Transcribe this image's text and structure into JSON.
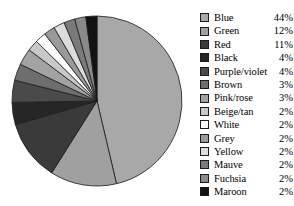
{
  "chart_data": {
    "type": "pie",
    "title": "",
    "subtitle": "",
    "xlabel": "",
    "ylabel": "",
    "grid": false,
    "legend_position": "right",
    "start_angle_deg": 0,
    "direction": "clockwise",
    "categories": [
      "Blue",
      "Green",
      "Red",
      "Black",
      "Purple/violet",
      "Brown",
      "Pink/rose",
      "Beige/tan",
      "White",
      "Grey",
      "Yellow",
      "Mauve",
      "Fuchsia",
      "Maroon"
    ],
    "values": [
      44,
      12,
      11,
      4,
      4,
      3,
      3,
      2,
      2,
      2,
      2,
      2,
      2,
      2
    ],
    "value_labels": [
      "44%",
      "12%",
      "11%",
      "4%",
      "4%",
      "3%",
      "3%",
      "2%",
      "2%",
      "2%",
      "2%",
      "2%",
      "2%",
      "2%"
    ],
    "unit": "%",
    "total": 95,
    "slice_colors": [
      "#a8a8a8",
      "#a0a0a0",
      "#3a3a3a",
      "#262626",
      "#4a4a4a",
      "#6e6e6e",
      "#a3a3a3",
      "#c8c8c8",
      "#ffffff",
      "#9a9a9a",
      "#dcdcdc",
      "#7a7a7a",
      "#8a8a8a",
      "#121212"
    ],
    "slice_stroke": "#1a1a1a"
  },
  "legend": {
    "items": [
      {
        "label": "Blue",
        "value": "44%",
        "swatch": "#a8a8a8"
      },
      {
        "label": "Green",
        "value": "12%",
        "swatch": "#a0a0a0"
      },
      {
        "label": "Red",
        "value": "11%",
        "swatch": "#3a3a3a"
      },
      {
        "label": "Black",
        "value": "4%",
        "swatch": "#262626"
      },
      {
        "label": "Purple/violet",
        "value": "4%",
        "swatch": "#4a4a4a"
      },
      {
        "label": "Brown",
        "value": "3%",
        "swatch": "#6e6e6e"
      },
      {
        "label": "Pink/rose",
        "value": "3%",
        "swatch": "#a3a3a3"
      },
      {
        "label": "Beige/tan",
        "value": "2%",
        "swatch": "#c8c8c8"
      },
      {
        "label": "White",
        "value": "2%",
        "swatch": "#ffffff"
      },
      {
        "label": "Grey",
        "value": "2%",
        "swatch": "#9a9a9a"
      },
      {
        "label": "Yellow",
        "value": "2%",
        "swatch": "#dcdcdc"
      },
      {
        "label": "Mauve",
        "value": "2%",
        "swatch": "#7a7a7a"
      },
      {
        "label": "Fuchsia",
        "value": "2%",
        "swatch": "#8a8a8a"
      },
      {
        "label": "Maroon",
        "value": "2%",
        "swatch": "#121212"
      }
    ]
  },
  "pie_geometry": {
    "center_x": 97,
    "center_y": 101,
    "radius": 85
  }
}
